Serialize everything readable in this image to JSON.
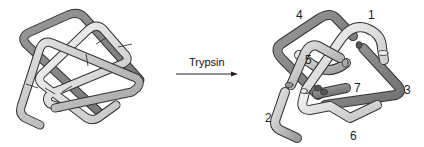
{
  "figure": {
    "type": "protein-domain-cleavage-diagram",
    "left_panel": {
      "description": "intact folded polypeptide chain with cleavage marks"
    },
    "arrow": {
      "label": "Trypsin"
    },
    "right_panel": {
      "description": "polypeptide cleaved into numbered fragments",
      "fragment_labels": [
        "1",
        "2",
        "3",
        "4",
        "5",
        "6",
        "7"
      ]
    }
  },
  "colors": {
    "dark_tube": "#8c8c8c",
    "mid_tube": "#b4b4b4",
    "light_tube": "#dcdcdc",
    "outline": "#3a3a3a",
    "text": "#222222"
  }
}
